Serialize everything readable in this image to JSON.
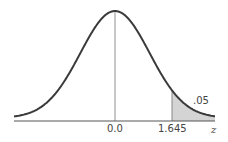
{
  "chart_data": {
    "type": "area",
    "title": "",
    "xlabel": "z",
    "ylabel": "",
    "x_ticks": [
      "0.0",
      "1.645"
    ],
    "mean": 0.0,
    "critical_value": 1.645,
    "shaded_region": {
      "from": 1.645,
      "to": "inf",
      "area": 0.05,
      "label": ".05"
    },
    "grid": false,
    "legend": "none"
  },
  "labels": {
    "mean": "0.0",
    "critical": "1.645",
    "axis": "z",
    "area": ".05"
  },
  "colors": {
    "curve": "#3a3a3a",
    "shade": "#d4d4d4",
    "axis": "#555555"
  }
}
